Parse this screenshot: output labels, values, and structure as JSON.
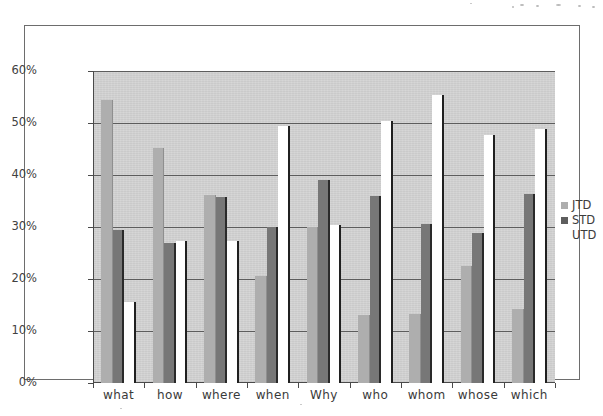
{
  "chart_data": {
    "type": "bar",
    "title": "",
    "subtitle": "",
    "xlabel": "",
    "ylabel": "",
    "ylim": [
      0,
      60
    ],
    "y_tick_labels": [
      "0%",
      "10%",
      "20%",
      "30%",
      "40%",
      "50%",
      "60%"
    ],
    "y_tick_values": [
      0,
      10,
      20,
      30,
      40,
      50,
      60
    ],
    "grid": true,
    "legend_position": "right",
    "categories": [
      "what",
      "how",
      "where",
      "when",
      "Why",
      "who",
      "whom",
      "whose",
      "which"
    ],
    "series": [
      {
        "name": "JTD",
        "color": "#aeaeae",
        "values": [
          54.5,
          45.2,
          36.1,
          20.5,
          30.0,
          13.1,
          13.3,
          22.5,
          14.3
        ]
      },
      {
        "name": "STD",
        "color": "#777777",
        "values": [
          29.4,
          26.9,
          35.7,
          30.0,
          39.0,
          35.9,
          30.5,
          28.8,
          36.4
        ]
      },
      {
        "name": "UTD",
        "color": "#ffffff",
        "values": [
          15.5,
          27.4,
          27.4,
          49.4,
          30.4,
          50.4,
          55.4,
          47.7,
          48.8
        ]
      }
    ]
  },
  "legend": {
    "entries": [
      {
        "label": "JTD",
        "swatch": "jtd"
      },
      {
        "label": "STD",
        "swatch": "std"
      },
      {
        "label": "UTD",
        "swatch": "utd"
      }
    ]
  }
}
